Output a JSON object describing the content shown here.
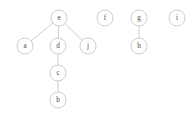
{
  "diagram": {
    "background_color": "#ffffff",
    "node_stroke_color": "#c4c4c4",
    "node_fill_color": "#ffffff",
    "edge_color": "#c8c8c8",
    "label_color": "#4a4a4a",
    "node_radius": 8,
    "nodes": [
      {
        "id": "e",
        "label": "e",
        "x": 59,
        "y": 18
      },
      {
        "id": "f",
        "label": "f",
        "x": 105,
        "y": 18
      },
      {
        "id": "g",
        "label": "g",
        "x": 139,
        "y": 18
      },
      {
        "id": "i",
        "label": "i",
        "x": 177,
        "y": 18
      },
      {
        "id": "a",
        "label": "a",
        "x": 25,
        "y": 46
      },
      {
        "id": "d",
        "label": "d",
        "x": 58,
        "y": 46
      },
      {
        "id": "j",
        "label": "j",
        "x": 88,
        "y": 46
      },
      {
        "id": "h",
        "label": "h",
        "x": 139,
        "y": 46
      },
      {
        "id": "c",
        "label": "c",
        "x": 58,
        "y": 73
      },
      {
        "id": "b",
        "label": "b",
        "x": 58,
        "y": 100
      }
    ],
    "edges": [
      {
        "id": "e-a",
        "source": "e",
        "target": "a"
      },
      {
        "id": "e-d",
        "source": "e",
        "target": "d"
      },
      {
        "id": "e-j",
        "source": "e",
        "target": "j"
      },
      {
        "id": "d-c",
        "source": "d",
        "target": "c"
      },
      {
        "id": "c-b",
        "source": "c",
        "target": "b"
      },
      {
        "id": "g-h",
        "source": "g",
        "target": "h"
      }
    ]
  }
}
